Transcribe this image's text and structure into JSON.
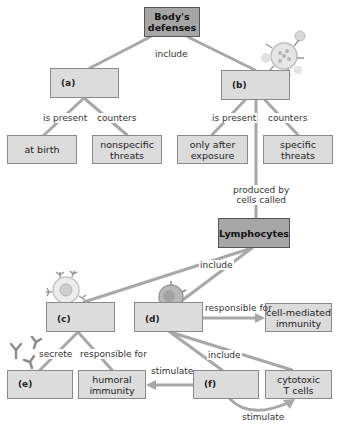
{
  "diagram": {
    "type": "concept-map",
    "nodes": {
      "root": "Body's\ndefenses",
      "a": "(a)",
      "b": "(b)",
      "at_birth": "at birth",
      "nonspecific": "nonspecific\nthreats",
      "after_exposure": "only after\nexposure",
      "specific": "specific\nthreats",
      "lymphocytes": "Lymphocytes",
      "c": "(c)",
      "d": "(d)",
      "cell_mediated": "cell-mediated\nimmunity",
      "e": "(e)",
      "humoral": "humoral\nimmunity",
      "f": "(f)",
      "cytotoxic": "cytotoxic\nT cells"
    },
    "labels": {
      "include_top": "include",
      "a_is_present": "is present",
      "a_counters": "counters",
      "b_is_present": "is present",
      "b_counters": "counters",
      "produced_by": "produced by\ncells called",
      "include_lymph": "include",
      "d_responsible": "responsible for",
      "c_secrete": "secrete",
      "c_responsible": "responsible for",
      "include_d": "include",
      "f_stimulate_left": "stimulate",
      "f_stimulate_bottom": "stimulate"
    },
    "colors": {
      "box_fill": "#dcdcdc",
      "box_dark_fill": "#a6a6a6",
      "line": "#a8a8a8"
    }
  }
}
